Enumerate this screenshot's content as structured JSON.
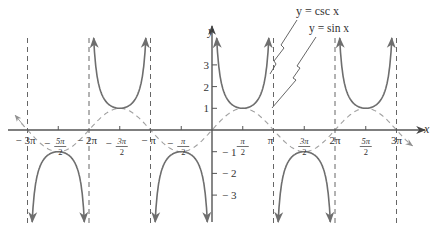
{
  "chart_data": {
    "type": "line",
    "title": "",
    "xlabel": "x",
    "ylabel": "y",
    "grid": false,
    "legend_position": "annotations top-right",
    "x_tick_labels": [
      "− 3π",
      "− 5π/2",
      "− 2π",
      "− 3π/2",
      "− π",
      "− π/2",
      "π/2",
      "π",
      "3π/2",
      "2π",
      "5π/2",
      "3π"
    ],
    "x_ticks_radians": [
      -9.42478,
      -7.85398,
      -6.28319,
      -4.71239,
      -3.14159,
      -1.5708,
      1.5708,
      3.14159,
      4.71239,
      6.28319,
      7.85398,
      9.42478
    ],
    "y_tick_labels": [
      "3",
      "2",
      "1",
      "− 1",
      "− 2",
      "− 3"
    ],
    "y_ticks": [
      3,
      2,
      1,
      -1,
      -2,
      -3
    ],
    "xlim": [
      -3.2,
      3.3
    ],
    "ylim": [
      -4.2,
      4.3
    ],
    "xlim_units": "multiples of π",
    "asymptotes_x": [
      "−3π",
      "−2π",
      "−π",
      "π",
      "2π",
      "3π"
    ],
    "series": [
      {
        "name": "y = csc x",
        "style": "solid",
        "color": "#666666",
        "function": "csc(x)",
        "domain": [
          -9.42478,
          9.42478
        ],
        "key_points": [
          {
            "x": "−5π/2",
            "y": -1
          },
          {
            "x": "−3π/2",
            "y": 1
          },
          {
            "x": "−π/2",
            "y": -1
          },
          {
            "x": "π/2",
            "y": 1
          },
          {
            "x": "3π/2",
            "y": -1
          },
          {
            "x": "5π/2",
            "y": 1
          }
        ]
      },
      {
        "name": "y = sin x",
        "style": "dashed",
        "color": "#999999",
        "function": "sin(x)",
        "domain": [
          -9.6,
          10.0
        ],
        "key_points": [
          {
            "x": "−3π",
            "y": 0
          },
          {
            "x": "−5π/2",
            "y": -1
          },
          {
            "x": "−2π",
            "y": 0
          },
          {
            "x": "−3π/2",
            "y": 1
          },
          {
            "x": "−π",
            "y": 0
          },
          {
            "x": "−π/2",
            "y": -1
          },
          {
            "x": "0",
            "y": 0
          },
          {
            "x": "π/2",
            "y": 1
          },
          {
            "x": "π",
            "y": 0
          },
          {
            "x": "3π/2",
            "y": -1
          },
          {
            "x": "2π",
            "y": 0
          },
          {
            "x": "5π/2",
            "y": 1
          },
          {
            "x": "3π",
            "y": 0
          }
        ]
      }
    ],
    "annotations": [
      "y = csc x",
      "y = sin x"
    ]
  },
  "labels": {
    "x_axis": "x",
    "y_axis": "y",
    "csc_label": "y = csc x",
    "sin_label": "y = sin x",
    "xticks": [
      {
        "pi": -3,
        "text": "− 3π",
        "frac": false
      },
      {
        "pi": -2.5,
        "num": "5π",
        "den": "2",
        "sign": "−",
        "frac": true
      },
      {
        "pi": -2,
        "text": "− 2π",
        "frac": false
      },
      {
        "pi": -1.5,
        "num": "3π",
        "den": "2",
        "sign": "−",
        "frac": true
      },
      {
        "pi": -1,
        "text": "− π",
        "frac": false
      },
      {
        "pi": -0.5,
        "num": "π",
        "den": "2",
        "sign": "−",
        "frac": true
      },
      {
        "pi": 0.5,
        "num": "π",
        "den": "2",
        "sign": "",
        "frac": true
      },
      {
        "pi": 1,
        "text": "π",
        "frac": false
      },
      {
        "pi": 1.5,
        "num": "3π",
        "den": "2",
        "sign": "",
        "frac": true
      },
      {
        "pi": 2,
        "text": "2π",
        "frac": false
      },
      {
        "pi": 2.5,
        "num": "5π",
        "den": "2",
        "sign": "",
        "frac": true
      },
      {
        "pi": 3,
        "text": "3π",
        "frac": false
      }
    ],
    "yticks": [
      {
        "v": 3,
        "text": "3"
      },
      {
        "v": 2,
        "text": "2"
      },
      {
        "v": 1,
        "text": "1"
      },
      {
        "v": -1,
        "text": "− 1"
      },
      {
        "v": -2,
        "text": "− 2"
      },
      {
        "v": -3,
        "text": "− 3"
      }
    ]
  },
  "colors": {
    "axis": "#555555",
    "csc": "#6e6e6e",
    "sin": "#a0a0a0",
    "asymptote": "#666666",
    "text": "#333333"
  }
}
